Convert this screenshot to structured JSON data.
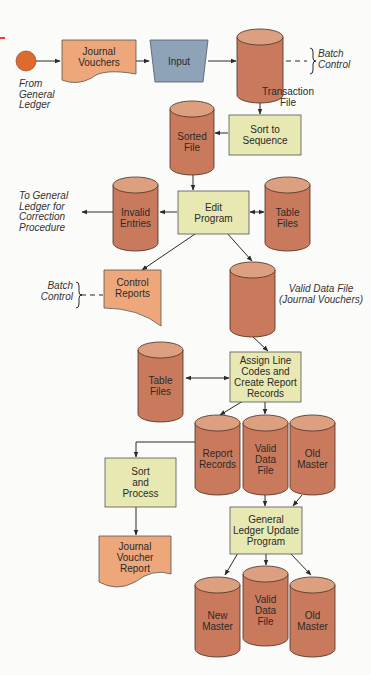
{
  "diagram": {
    "type": "system flowchart",
    "colors": {
      "storage": "#c97a5c",
      "storage_top": "#dc9f80",
      "process": "#e8e8b2",
      "document": "#eda77b",
      "input": "#8fa3b8",
      "terminal": "#e06a2c",
      "accent_mark": "#e0442c"
    },
    "annotations": {
      "from_general_ledger": [
        "From",
        "General",
        "Ledger"
      ],
      "batch_control_top": [
        "Batch",
        "Control"
      ],
      "transaction_file": [
        "Transaction",
        "File"
      ],
      "to_general_ledger": [
        "To General",
        "Ledger for",
        "Correction",
        "Procedure"
      ],
      "batch_control_left": [
        "Batch",
        "Control"
      ],
      "valid_data_file_jv": [
        "Valid Data File",
        "(Journal Vouchers)"
      ]
    },
    "nodes": {
      "start": {
        "shape": "terminal",
        "label": ""
      },
      "journal_vouchers": {
        "shape": "document",
        "lines": [
          "Journal",
          "Vouchers"
        ]
      },
      "input": {
        "shape": "manual-input",
        "lines": [
          "Input"
        ]
      },
      "transaction_file": {
        "shape": "storage",
        "lines": []
      },
      "sort_to_sequence": {
        "shape": "process",
        "lines": [
          "Sort to",
          "Sequence"
        ]
      },
      "sorted_file": {
        "shape": "storage",
        "lines": [
          "Sorted",
          "File"
        ]
      },
      "edit_program": {
        "shape": "process",
        "lines": [
          "Edit",
          "Program"
        ]
      },
      "invalid_entries": {
        "shape": "storage",
        "lines": [
          "Invalid",
          "Entries"
        ]
      },
      "table_files_1": {
        "shape": "storage",
        "lines": [
          "Table",
          "Files"
        ]
      },
      "control_reports": {
        "shape": "document",
        "lines": [
          "Control",
          "Reports"
        ]
      },
      "valid_data_file_1": {
        "shape": "storage",
        "lines": []
      },
      "assign_line_codes": {
        "shape": "process",
        "lines": [
          "Assign Line",
          "Codes and",
          "Create Report",
          "Records"
        ]
      },
      "table_files_2": {
        "shape": "storage",
        "lines": [
          "Table",
          "Files"
        ]
      },
      "report_records": {
        "shape": "storage",
        "lines": [
          "Report",
          "Records"
        ]
      },
      "valid_data_file_2": {
        "shape": "storage",
        "lines": [
          "Valid",
          "Data",
          "File"
        ]
      },
      "old_master_1": {
        "shape": "storage",
        "lines": [
          "Old",
          "Master"
        ]
      },
      "sort_and_process": {
        "shape": "process",
        "lines": [
          "Sort",
          "and",
          "Process"
        ]
      },
      "journal_voucher_report": {
        "shape": "document",
        "lines": [
          "Journal",
          "Voucher",
          "Report"
        ]
      },
      "gl_update_program": {
        "shape": "process",
        "lines": [
          "General",
          "Ledger Update",
          "Program"
        ]
      },
      "new_master": {
        "shape": "storage",
        "lines": [
          "New",
          "Master"
        ]
      },
      "valid_data_file_3": {
        "shape": "storage",
        "lines": [
          "Valid",
          "Data",
          "File"
        ]
      },
      "old_master_2": {
        "shape": "storage",
        "lines": [
          "Old",
          "Master"
        ]
      }
    },
    "edges": [
      [
        "start",
        "journal_vouchers"
      ],
      [
        "journal_vouchers",
        "input"
      ],
      [
        "input",
        "transaction_file"
      ],
      [
        "transaction_file",
        "sort_to_sequence"
      ],
      [
        "sort_to_sequence",
        "sorted_file"
      ],
      [
        "sorted_file",
        "edit_program"
      ],
      [
        "edit_program",
        "invalid_entries"
      ],
      [
        "invalid_entries",
        "to_general_ledger"
      ],
      [
        "edit_program",
        "table_files_1",
        "bidirectional"
      ],
      [
        "edit_program",
        "control_reports"
      ],
      [
        "edit_program",
        "valid_data_file_1"
      ],
      [
        "valid_data_file_1",
        "assign_line_codes"
      ],
      [
        "table_files_2",
        "assign_line_codes",
        "bidirectional"
      ],
      [
        "assign_line_codes",
        "report_records"
      ],
      [
        "assign_line_codes",
        "valid_data_file_2"
      ],
      [
        "report_records",
        "sort_and_process"
      ],
      [
        "sort_and_process",
        "journal_voucher_report"
      ],
      [
        "valid_data_file_2",
        "gl_update_program"
      ],
      [
        "old_master_1",
        "gl_update_program"
      ],
      [
        "gl_update_program",
        "new_master"
      ],
      [
        "gl_update_program",
        "valid_data_file_3"
      ],
      [
        "gl_update_program",
        "old_master_2"
      ]
    ]
  }
}
